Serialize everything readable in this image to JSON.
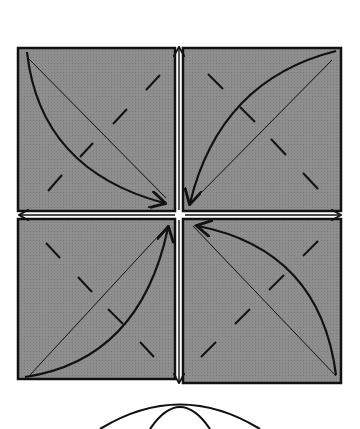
{
  "diagram": {
    "type": "origami-fold-diagram",
    "colors": {
      "background": "#ffffff",
      "paper": "#8c8c8c",
      "line": "#111111",
      "gap": "#ffffff"
    },
    "quadrants": [
      {
        "id": "top-left",
        "arrow_direction": "top-left-corner-to-center"
      },
      {
        "id": "top-right",
        "arrow_direction": "top-right-corner-to-center"
      },
      {
        "id": "bottom-left",
        "arrow_direction": "bottom-left-corner-to-center"
      },
      {
        "id": "bottom-right",
        "arrow_direction": "bottom-right-corner-to-center"
      }
    ],
    "center_arrows": [
      "up",
      "down",
      "left",
      "right"
    ],
    "next_step_hint": "curved outline shape partially visible below"
  }
}
